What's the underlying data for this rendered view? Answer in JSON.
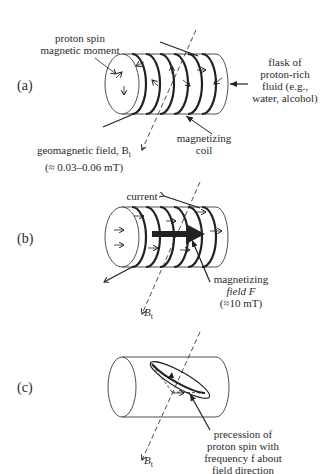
{
  "panels": {
    "a": {
      "label": "(a)",
      "proton_spin_l1": "proton spin",
      "proton_spin_l2": "magnetic moment",
      "flask_l1": "flask of",
      "flask_l2": "proton-rich",
      "flask_l3": "fluid (e.g.,",
      "flask_l4": "water, alcohol)",
      "coil_l1": "magnetizing",
      "coil_l2": "coil",
      "geo_l1": "geomagnetic field, B",
      "geo_sub": "t",
      "geo_l2": "(≈ 0.03–0.06 mT)"
    },
    "b": {
      "label": "(b)",
      "current": "current",
      "field_l1": "magnetizing",
      "field_l2": "field F",
      "field_l3": "(≈10 mT)",
      "bt": "B",
      "bt_sub": "t"
    },
    "c": {
      "label": "(c)",
      "prec_l1": "precession of",
      "prec_l2": "proton spin with",
      "prec_l3": "frequency f about",
      "prec_l4": "field direction",
      "bt": "B",
      "bt_sub": "t"
    }
  },
  "colors": {
    "stroke": "#222222",
    "background": "#ffffff"
  }
}
